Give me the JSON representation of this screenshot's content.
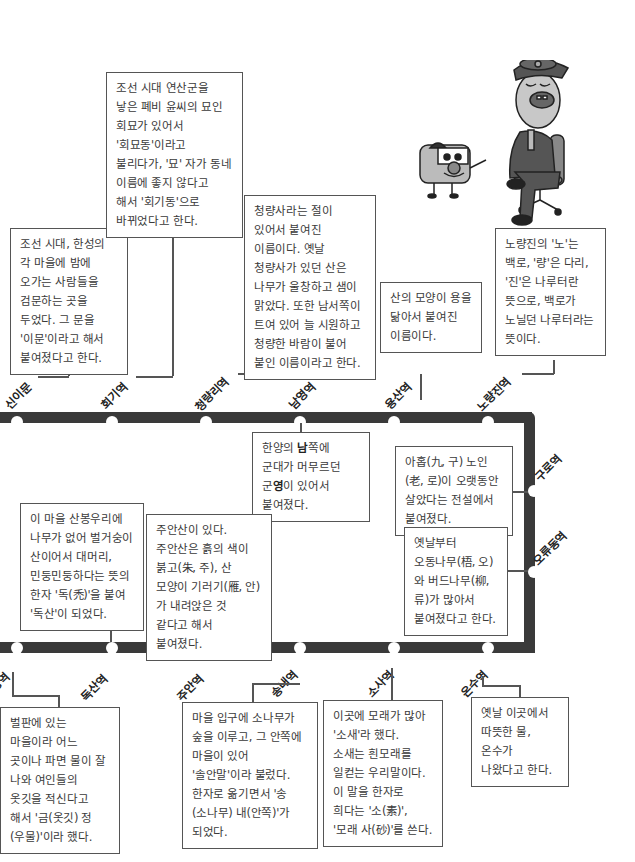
{
  "line_color": "#3a3a3a",
  "stations_top": [
    {
      "name": "신이문",
      "desc": "조선 시대, 한성의 각 마을에 밤에 오가는 사람들을 검문하는 곳을 두었다. 그 문을 '이문'이라고 해서 붙여졌다고 한다."
    },
    {
      "name": "회기역",
      "desc": "조선 시대 연산군을 낳은 폐비 윤씨의 묘인 회묘가 있어서 '회묘동'이라고 불리다가, '묘' 자가 동네 이름에 좋지 않다고 해서 '회기동'으로 바뀌었다고 한다."
    },
    {
      "name": "청량리역",
      "desc": "청량사라는 절이 있어서 붙여진 이름이다. 옛날 청량사가 있던 산은 나무가 울창하고 샘이 맑았다. 또한 남서쪽이 트여 있어 늘 시원하고 청량한 바람이 불어 붙인 이름이라고 한다."
    },
    {
      "name": "남영역",
      "desc_pre1": "한양의 ",
      "desc_b1": "남",
      "desc_mid": "쪽에 군대가 머무르던 군",
      "desc_b2": "영",
      "desc_post": "이 있어서 붙여졌다."
    },
    {
      "name": "용산역",
      "desc": "산의 모양이 용을 닮아서 붙여진 이름이다."
    },
    {
      "name": "노량진역",
      "desc": "노량진의 '노'는 백로, '량'은 다리, '진'은 나루터란 뜻으로, 백로가 노닐던 나루터라는 뜻이다."
    }
  ],
  "stations_right": [
    {
      "name": "구로역",
      "desc": "아홉(九, 구) 노인(老, 로)이 오랫동안 살았다는 전설에서 붙여졌다."
    },
    {
      "name": "오류동역",
      "desc": "옛날부터 오동나무(梧, 오)와 버드나무(柳, 류)가 많아서 붙여졌다고 한다."
    }
  ],
  "stations_bottom": [
    {
      "name": "금정역",
      "desc": "벌판에 있는 마을이라 어느 곳이나 파면 물이 잘 나와 여인들의 옷깃을 적신다고 해서 '금(옷깃) 정(우물)'이라 했다."
    },
    {
      "name": "독산역",
      "desc": "이 마을 산봉우리에 나무가 없어 벌거숭이 산이어서 대머리, 민둥민둥하다는 뜻의 한자 '독(禿)'을 붙여 '독산'이 되었다."
    },
    {
      "name": "주안역",
      "desc": "주안산이 있다. 주안산은 흙의 색이 붉고(朱, 주), 산 모양이 기러기(雁, 안)가 내려앉은 것 같다고 해서 붙여졌다."
    },
    {
      "name": "송내역",
      "desc": "마을 입구에 소나무가 숲을 이루고, 그 안쪽에 마을이 있어 '솔안말'이라 불렀다. 한자로 옮기면서 '송(소나무) 내(안쪽)'가 되었다."
    },
    {
      "name": "소사역",
      "desc": "이곳에 모래가 많아 '소새'라 했다. 소새는 흰모래를 일컫는 우리말이다. 이 말을 한자로 희다는 '소(素)', '모래 사(砂)'를 쓴다."
    },
    {
      "name": "온수역",
      "desc": "옛날 이곳에서 따뜻한 물, 온수가 나왔다고 한다."
    }
  ]
}
